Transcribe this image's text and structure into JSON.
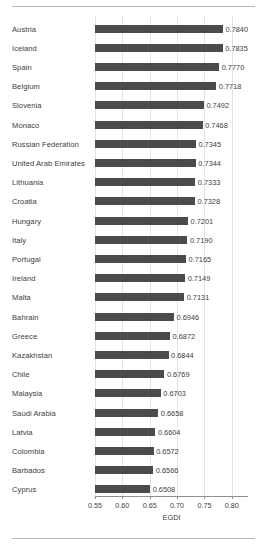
{
  "chart_data": {
    "type": "bar",
    "orientation": "horizontal",
    "title": "",
    "xlabel": "EGDI",
    "ylabel": "",
    "xlim": [
      0.55,
      0.83
    ],
    "xticks": [
      "0.55",
      "0.60",
      "0.65",
      "0.70",
      "0.75",
      "0.80"
    ],
    "xtick_values": [
      0.55,
      0.6,
      0.65,
      0.7,
      0.75,
      0.8
    ],
    "grid": "vertical",
    "legend": "none",
    "bar_color": "#4b4b4b",
    "gridline_color": "#e2e2e2",
    "axis_color": "#8f8f8f",
    "categories": [
      "Austria",
      "Iceland",
      "Spain",
      "Belgium",
      "Slovenia",
      "Monaco",
      "Russian Federation",
      "United Arab Emirates",
      "Lithuania",
      "Croatia",
      "Hungary",
      "Italy",
      "Portugal",
      "Ireland",
      "Malta",
      "Bahrain",
      "Greece",
      "Kazakhstan",
      "Chile",
      "Malaysia",
      "Saudi Arabia",
      "Latvia",
      "Colombia",
      "Barbados",
      "Cyprus"
    ],
    "values": [
      0.784,
      0.7835,
      0.777,
      0.7718,
      0.7492,
      0.7468,
      0.7345,
      0.7344,
      0.7333,
      0.7328,
      0.7201,
      0.719,
      0.7165,
      0.7149,
      0.7131,
      0.6946,
      0.6872,
      0.6844,
      0.6769,
      0.6703,
      0.6658,
      0.6604,
      0.6572,
      0.6566,
      0.6508
    ],
    "value_labels": [
      "0.7840",
      "0.7835",
      "0.7770",
      "0.7718",
      "0.7492",
      "0.7468",
      "0.7345",
      "0.7344",
      "0.7333",
      "0.7328",
      "0.7201",
      "0.7190",
      "0.7165",
      "0.7149",
      "0.7131",
      "0.6946",
      "0.6872",
      "0.6844",
      "0.6769",
      "0.6703",
      "0.6658",
      "0.6604",
      "0.6572",
      "0.6566",
      "0.6508"
    ]
  }
}
